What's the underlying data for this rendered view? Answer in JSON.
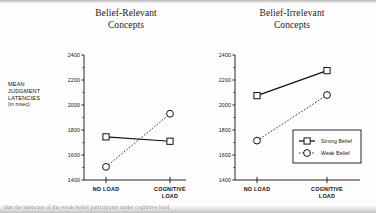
{
  "figure": {
    "y_axis_caption_lines": [
      "MEAN",
      "JUDGMENT",
      "LATENCIES"
    ],
    "y_axis_caption_units": "(in msec)",
    "bottom_caption_fragment": "that the latencies of the weak belief participants under cognitive load"
  },
  "legend": {
    "strong_label": "Strong Belief",
    "weak_label": "Weak Belief"
  },
  "chart_data": [
    {
      "type": "line",
      "title": "Belief-Relevant",
      "title_line2": "Concepts",
      "xlabel": "",
      "ylabel": "MEAN JUDGMENT LATENCIES (in msec)",
      "categories": [
        "NO LOAD",
        "COGNITIVE LOAD"
      ],
      "category_lines": [
        [
          "NO LOAD"
        ],
        [
          "COGNITIVE",
          "LOAD"
        ]
      ],
      "ylim": [
        1400,
        2400
      ],
      "yticks": [
        1400,
        1600,
        1800,
        2000,
        2200,
        2400
      ],
      "ytick_labels": [
        "1400",
        "1600",
        "1800",
        "2000",
        "2200",
        "2400"
      ],
      "minor_ticks": true,
      "grid": false,
      "legend_position": "none",
      "series": [
        {
          "name": "Strong Belief",
          "values": [
            1745,
            1710
          ],
          "marker": "square",
          "linestyle": "solid"
        },
        {
          "name": "Weak Belief",
          "values": [
            1505,
            1930
          ],
          "marker": "circle",
          "linestyle": "dotted"
        }
      ]
    },
    {
      "type": "line",
      "title": "Belief-Irrelevant",
      "title_line2": "Concepts",
      "xlabel": "",
      "ylabel": "",
      "categories": [
        "NO LOAD",
        "COGNITIVE LOAD"
      ],
      "category_lines": [
        [
          "NO LOAD"
        ],
        [
          "COGNITIVE",
          "LOAD"
        ]
      ],
      "ylim": [
        1400,
        2400
      ],
      "yticks": [
        1400,
        1600,
        1800,
        2000,
        2200,
        2400
      ],
      "ytick_labels": [
        "1400",
        "1600",
        "1800",
        "2000",
        "2200",
        "2400"
      ],
      "minor_ticks": true,
      "grid": false,
      "legend_position": "lower right",
      "series": [
        {
          "name": "Strong Belief",
          "values": [
            2075,
            2275
          ],
          "marker": "square",
          "linestyle": "solid"
        },
        {
          "name": "Weak Belief",
          "values": [
            1715,
            2080
          ],
          "marker": "circle",
          "linestyle": "dotted"
        }
      ]
    }
  ],
  "colors": {
    "ink": "#111111",
    "axis": "#1a1a1a",
    "paper": "#fdfdfd"
  }
}
